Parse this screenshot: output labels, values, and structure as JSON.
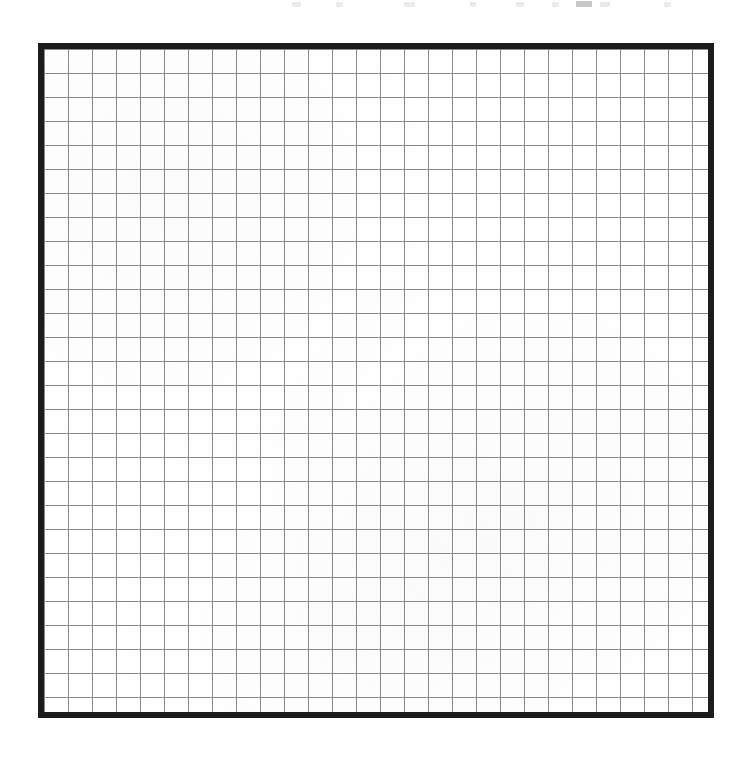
{
  "document": {
    "kind": "blank-graph-paper-grid",
    "background_color": "#ffffff",
    "width_px": 742,
    "height_px": 757
  },
  "frame": {
    "border_color": "#1c1c1c",
    "border_width_px": 6,
    "left_px": 38,
    "top_px": 43,
    "width_px": 676,
    "height_px": 675,
    "fill_color": "#ffffff"
  },
  "grid": {
    "line_color": "#8a8a8a",
    "line_width_px": 1,
    "cell_size_px": 24,
    "columns": 28,
    "rows": 28,
    "has_major_gridlines": false,
    "has_axis_labels": false,
    "has_tick_labels": false
  },
  "artifacts": {
    "note": "faint residual marks along the top trim edge of the scan",
    "specks": [
      {
        "left_px": 292,
        "width_px": 9,
        "tone": "light"
      },
      {
        "left_px": 336,
        "width_px": 7,
        "tone": "light"
      },
      {
        "left_px": 404,
        "width_px": 11,
        "tone": "light"
      },
      {
        "left_px": 470,
        "width_px": 6,
        "tone": "light"
      },
      {
        "left_px": 516,
        "width_px": 8,
        "tone": "light"
      },
      {
        "left_px": 552,
        "width_px": 7,
        "tone": "light"
      },
      {
        "left_px": 576,
        "width_px": 16,
        "tone": "dark"
      },
      {
        "left_px": 600,
        "width_px": 10,
        "tone": "light"
      },
      {
        "left_px": 664,
        "width_px": 7,
        "tone": "light"
      }
    ]
  },
  "chart_data": {
    "type": "table",
    "title": "",
    "subtitle": "",
    "xlabel": "",
    "ylabel": "",
    "categories": [],
    "values": [],
    "series": [],
    "annotations": [],
    "legend": [],
    "grid": true,
    "legend_position": "none",
    "xlim": [
      0,
      28
    ],
    "ylim": [
      0,
      28
    ],
    "xticks": [],
    "yticks": [],
    "note": "Empty plotting grid — 28 by 28 ruled cells, no plotted data, no axis tick labels, no legend."
  }
}
